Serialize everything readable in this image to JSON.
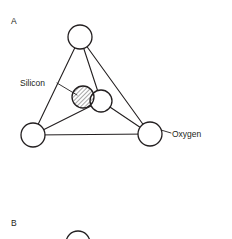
{
  "figure": {
    "background_color": "#ffffff",
    "line_color": "#231f20",
    "panels": [
      {
        "letter": "A",
        "letter_x": 11,
        "letter_y": 24,
        "caption": ""
      },
      {
        "letter": "B",
        "letter_x": 11,
        "letter_y": 226,
        "caption": ""
      }
    ],
    "labels": [
      {
        "id": "silicon",
        "text": "Silicon",
        "x": 20,
        "y": 85,
        "leader": {
          "x1": 58,
          "y1": 83,
          "x2": 76,
          "y2": 95
        }
      },
      {
        "id": "oxygen",
        "text": "Oxygen",
        "x": 172,
        "y": 137,
        "leader": {
          "x1": 161,
          "y1": 129,
          "x2": 170,
          "y2": 133
        }
      }
    ],
    "atoms": [
      {
        "id": "oxygen-top",
        "element": "Oxygen",
        "cx": 80,
        "cy": 37,
        "r": 12,
        "fill": "white"
      },
      {
        "id": "oxygen-bottom-left",
        "element": "Oxygen",
        "cx": 33,
        "cy": 135,
        "r": 12,
        "fill": "white"
      },
      {
        "id": "oxygen-bottom-right",
        "element": "Oxygen",
        "cx": 150,
        "cy": 134,
        "r": 12,
        "fill": "white"
      },
      {
        "id": "oxygen-center",
        "element": "Oxygen",
        "cx": 101,
        "cy": 101,
        "r": 11,
        "fill": "white"
      },
      {
        "id": "silicon-center",
        "element": "Silicon",
        "cx": 83,
        "cy": 97,
        "r": 11,
        "fill": "hatched"
      }
    ],
    "bonds": [
      {
        "from": "oxygen-top",
        "to": "oxygen-bottom-left"
      },
      {
        "from": "oxygen-top",
        "to": "oxygen-bottom-right"
      },
      {
        "from": "oxygen-bottom-left",
        "to": "oxygen-bottom-right"
      },
      {
        "from": "oxygen-top",
        "to": "oxygen-center"
      },
      {
        "from": "oxygen-bottom-left",
        "to": "oxygen-center"
      },
      {
        "from": "oxygen-bottom-right",
        "to": "oxygen-center"
      }
    ],
    "partial_atom_bottom": {
      "id": "panel-b-top-atom",
      "cx": 78,
      "cy": 243,
      "r": 12
    },
    "hatch": {
      "angle_degrees": 45,
      "spacing": 3
    }
  }
}
